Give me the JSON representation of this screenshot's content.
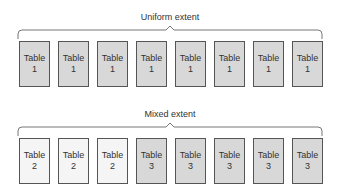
{
  "uniform": {
    "title": "Uniform extent",
    "tables": [
      {
        "label": "Table",
        "num": "1",
        "kind": "t1"
      },
      {
        "label": "Table",
        "num": "1",
        "kind": "t1"
      },
      {
        "label": "Table",
        "num": "1",
        "kind": "t1"
      },
      {
        "label": "Table",
        "num": "1",
        "kind": "t1"
      },
      {
        "label": "Table",
        "num": "1",
        "kind": "t1"
      },
      {
        "label": "Table",
        "num": "1",
        "kind": "t1"
      },
      {
        "label": "Table",
        "num": "1",
        "kind": "t1"
      },
      {
        "label": "Table",
        "num": "1",
        "kind": "t1"
      }
    ]
  },
  "mixed": {
    "title": "Mixed extent",
    "tables": [
      {
        "label": "Table",
        "num": "2",
        "kind": "t2"
      },
      {
        "label": "Table",
        "num": "2",
        "kind": "t2"
      },
      {
        "label": "Table",
        "num": "2",
        "kind": "t2"
      },
      {
        "label": "Table",
        "num": "3",
        "kind": "t3"
      },
      {
        "label": "Table",
        "num": "3",
        "kind": "t3"
      },
      {
        "label": "Table",
        "num": "3",
        "kind": "t3"
      },
      {
        "label": "Table",
        "num": "3",
        "kind": "t3"
      },
      {
        "label": "Table",
        "num": "3",
        "kind": "t3"
      }
    ]
  },
  "colors": {
    "table1_fill": "#d8d8d8",
    "table2_fill": "#f5f5f5",
    "table3_fill": "#d8d8d8",
    "border": "#555555"
  }
}
